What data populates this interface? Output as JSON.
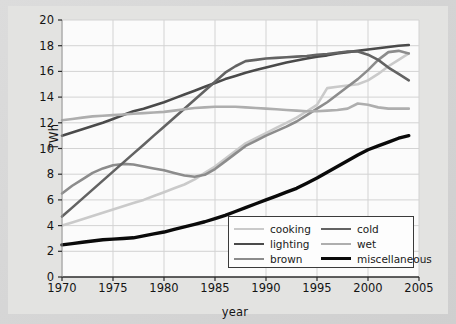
{
  "chart_data": {
    "type": "line",
    "title": "",
    "xlabel": "year",
    "ylabel": "TWh",
    "xlim": [
      1970,
      2005
    ],
    "ylim": [
      0,
      20
    ],
    "xticks": [
      1970,
      1975,
      1980,
      1985,
      1990,
      1995,
      2000,
      2005
    ],
    "yticks": [
      0,
      2,
      4,
      6,
      8,
      10,
      12,
      14,
      16,
      18,
      20
    ],
    "grid": true,
    "legend_position": "lower right",
    "x": [
      1970,
      1971,
      1972,
      1973,
      1974,
      1975,
      1976,
      1977,
      1978,
      1979,
      1980,
      1981,
      1982,
      1983,
      1984,
      1985,
      1986,
      1987,
      1988,
      1989,
      1990,
      1991,
      1992,
      1993,
      1994,
      1995,
      1996,
      1997,
      1998,
      1999,
      2000,
      2001,
      2002,
      2003,
      2004
    ],
    "series": [
      {
        "name": "cooking",
        "color": "#cacaca",
        "width": 2.6,
        "values": [
          4.0,
          4.25,
          4.5,
          4.75,
          5.0,
          5.25,
          5.5,
          5.75,
          6.0,
          6.3,
          6.6,
          6.9,
          7.2,
          7.6,
          8.1,
          8.6,
          9.2,
          9.8,
          10.4,
          10.8,
          11.2,
          11.6,
          12.0,
          12.4,
          12.9,
          13.4,
          14.7,
          14.8,
          14.9,
          15.0,
          15.3,
          15.8,
          16.4,
          16.9,
          17.4
        ]
      },
      {
        "name": "lighting",
        "color": "#4a4a4a",
        "width": 2.6,
        "values": [
          11.0,
          11.25,
          11.5,
          11.75,
          12.0,
          12.3,
          12.6,
          12.9,
          13.1,
          13.35,
          13.6,
          13.9,
          14.2,
          14.5,
          14.8,
          15.1,
          15.4,
          15.65,
          15.9,
          16.1,
          16.3,
          16.5,
          16.7,
          16.85,
          17.0,
          17.15,
          17.25,
          17.4,
          17.5,
          17.6,
          17.7,
          17.8,
          17.9,
          18.0,
          18.05
        ]
      },
      {
        "name": "brown",
        "color": "#8c8c8c",
        "width": 2.6,
        "values": [
          6.5,
          7.1,
          7.6,
          8.1,
          8.45,
          8.7,
          8.8,
          8.75,
          8.6,
          8.45,
          8.3,
          8.1,
          7.9,
          7.8,
          7.95,
          8.4,
          9.0,
          9.6,
          10.2,
          10.6,
          11.0,
          11.35,
          11.7,
          12.1,
          12.6,
          13.1,
          13.6,
          14.2,
          14.8,
          15.4,
          16.1,
          16.9,
          17.5,
          17.6,
          17.4
        ]
      },
      {
        "name": "cold",
        "color": "#636363",
        "width": 2.6,
        "values": [
          4.7,
          5.4,
          6.1,
          6.8,
          7.5,
          8.2,
          8.9,
          9.6,
          10.3,
          11.0,
          11.7,
          12.4,
          13.1,
          13.8,
          14.5,
          15.2,
          15.9,
          16.4,
          16.8,
          16.9,
          17.0,
          17.05,
          17.1,
          17.15,
          17.2,
          17.3,
          17.35,
          17.45,
          17.55,
          17.55,
          17.3,
          16.9,
          16.3,
          15.8,
          15.3
        ]
      },
      {
        "name": "wet",
        "color": "#aeaeae",
        "width": 2.6,
        "values": [
          12.2,
          12.3,
          12.4,
          12.5,
          12.55,
          12.6,
          12.65,
          12.7,
          12.75,
          12.8,
          12.85,
          12.95,
          13.05,
          13.15,
          13.2,
          13.25,
          13.25,
          13.25,
          13.2,
          13.15,
          13.1,
          13.05,
          13.0,
          12.95,
          12.9,
          12.9,
          12.95,
          13.0,
          13.1,
          13.5,
          13.4,
          13.2,
          13.1,
          13.1,
          13.1
        ]
      },
      {
        "name": "miscellaneous",
        "color": "#0a0a0a",
        "width": 3.4,
        "values": [
          2.5,
          2.6,
          2.7,
          2.8,
          2.9,
          2.95,
          3.0,
          3.05,
          3.2,
          3.35,
          3.5,
          3.7,
          3.9,
          4.1,
          4.3,
          4.55,
          4.8,
          5.1,
          5.4,
          5.7,
          6.0,
          6.3,
          6.6,
          6.9,
          7.3,
          7.7,
          8.15,
          8.6,
          9.05,
          9.5,
          9.9,
          10.2,
          10.5,
          10.8,
          11.0
        ]
      }
    ]
  },
  "axes": {
    "ylabel": "TWh",
    "xlabel": "year",
    "yticks": [
      "20",
      "18",
      "16",
      "14",
      "12",
      "10",
      "8",
      "6",
      "4",
      "2",
      "0"
    ],
    "xticks": [
      "1970",
      "1975",
      "1980",
      "1985",
      "1990",
      "1995",
      "2000",
      "2005"
    ]
  },
  "legend": {
    "entries": [
      {
        "label": "cooking",
        "color": "#cacaca",
        "width": 2.6
      },
      {
        "label": "cold",
        "color": "#636363",
        "width": 2.6
      },
      {
        "label": "lighting",
        "color": "#4a4a4a",
        "width": 2.8
      },
      {
        "label": "wet",
        "color": "#aeaeae",
        "width": 2.6
      },
      {
        "label": "brown",
        "color": "#8c8c8c",
        "width": 2.6
      },
      {
        "label": "miscellaneous",
        "color": "#0a0a0a",
        "width": 3.4
      }
    ]
  }
}
